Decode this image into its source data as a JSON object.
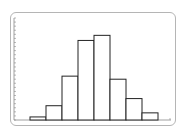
{
  "chart_data": {
    "type": "bar",
    "subtype": "histogram",
    "title": "",
    "xlabel": "",
    "ylabel": "",
    "categories": [
      "bin1",
      "bin2",
      "bin3",
      "bin4",
      "bin5",
      "bin6",
      "bin7",
      "bin8"
    ],
    "values": [
      3,
      14,
      43,
      78,
      83,
      40,
      21,
      7
    ],
    "ylim": [
      0,
      100
    ],
    "grid": false,
    "legend": null,
    "y_ticks_count": 25,
    "y_tick_labels": [],
    "x_tick_labels": []
  },
  "colors": {
    "frame": "#b5b5b5",
    "bar_fill": "#ffffff",
    "bar_stroke": "#222222",
    "axis": "#888888"
  }
}
